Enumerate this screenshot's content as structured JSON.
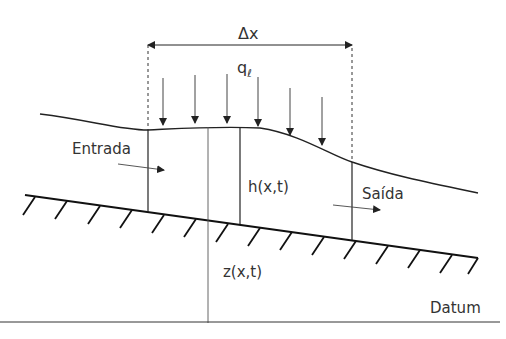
{
  "diagram": {
    "labels": {
      "dx": "Δx",
      "lateral_inflow": "q",
      "lateral_inflow_sub": "ℓ",
      "inflow": "Entrada",
      "outflow": "Saída",
      "depth": "h(x,t)",
      "bed_elevation": "z(x,t)",
      "datum": "Datum"
    },
    "colors": {
      "line": "#222222",
      "text": "#333333",
      "background": "#ffffff"
    }
  }
}
